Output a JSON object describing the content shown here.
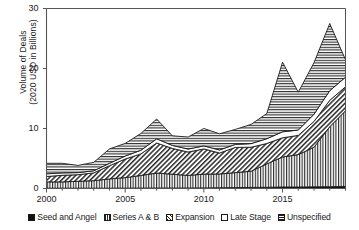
{
  "chart_data": {
    "type": "area",
    "title": "",
    "xlabel": "",
    "ylabel": "Volume of Deals\n(2020 USD in Billions)",
    "ylabel_line1": "Volume of Deals",
    "ylabel_line2": "(2020 USD in Billions)",
    "stacked": true,
    "xlim": [
      2000,
      2019
    ],
    "ylim": [
      0,
      30
    ],
    "yticks": [
      0,
      10,
      20,
      30
    ],
    "ytick_labels": [
      "0",
      "10",
      "20",
      "30"
    ],
    "xticks": [
      2000,
      2005,
      2010,
      2015
    ],
    "xtick_labels": [
      "2000",
      "2005",
      "2010",
      "2015"
    ],
    "minor_xticks_every": 1,
    "grid": false,
    "legend_position": "bottom",
    "x": [
      2000,
      2001,
      2002,
      2003,
      2004,
      2005,
      2006,
      2007,
      2008,
      2009,
      2010,
      2011,
      2012,
      2013,
      2014,
      2015,
      2016,
      2017,
      2018,
      2019
    ],
    "series": [
      {
        "name": "Seed and Angel",
        "pattern": "solid-black",
        "color": "#111111",
        "values": [
          0.05,
          0.05,
          0.05,
          0.05,
          0.05,
          0.06,
          0.07,
          0.08,
          0.08,
          0.08,
          0.1,
          0.12,
          0.15,
          0.18,
          0.2,
          0.25,
          0.25,
          0.28,
          0.3,
          0.35
        ]
      },
      {
        "name": "Series A & B",
        "pattern": "vertical-lines",
        "color": "#ffffff",
        "values": [
          1.05,
          1.05,
          1.15,
          1.25,
          1.55,
          1.75,
          2.1,
          2.5,
          2.3,
          2.1,
          2.3,
          2.3,
          2.5,
          2.7,
          3.9,
          5.0,
          5.4,
          6.6,
          10.0,
          12.6
        ]
      },
      {
        "name": "Expansion",
        "pattern": "diagonal-hatch",
        "color": "#ffffff",
        "values": [
          0.9,
          1.1,
          1.1,
          1.3,
          2.2,
          3.1,
          3.6,
          5.0,
          4.3,
          3.9,
          4.2,
          3.5,
          4.2,
          4.0,
          3.4,
          3.2,
          3.2,
          4.3,
          4.4,
          4.0
        ]
      },
      {
        "name": "Late Stage",
        "pattern": "white",
        "color": "#ffffff",
        "values": [
          0.45,
          0.4,
          0.35,
          0.35,
          0.4,
          0.5,
          0.6,
          0.7,
          0.5,
          0.5,
          0.5,
          0.5,
          0.5,
          0.6,
          0.8,
          1.0,
          0.9,
          1.2,
          1.6,
          1.6
        ]
      },
      {
        "name": "Unspecified",
        "pattern": "horizontal-lines",
        "color": "#ffffff",
        "values": [
          1.75,
          1.6,
          1.2,
          1.4,
          2.4,
          2.1,
          2.8,
          3.3,
          1.6,
          2.0,
          2.9,
          2.7,
          2.5,
          3.2,
          4.2,
          11.6,
          6.3,
          8.6,
          11.2,
          2.9
        ]
      }
    ],
    "totals": [
      4.2,
      4.2,
      3.85,
      4.35,
      6.6,
      7.5,
      9.2,
      11.6,
      8.8,
      8.6,
      10.0,
      9.1,
      9.9,
      10.7,
      12.5,
      21.0,
      16.0,
      21.0,
      27.5,
      21.5
    ]
  },
  "legend": {
    "items": [
      {
        "label": "Seed and Angel",
        "swatch": "sw-solid"
      },
      {
        "label": "Series A & B",
        "swatch": "sw-vert"
      },
      {
        "label": "Expansion",
        "swatch": "sw-diag"
      },
      {
        "label": "Late Stage",
        "swatch": "sw-white"
      },
      {
        "label": "Unspecified",
        "swatch": "sw-horz"
      }
    ]
  },
  "colors": {
    "ink": "#1a1a1a",
    "background": "#ffffff",
    "axis": "#4a4a4a"
  }
}
